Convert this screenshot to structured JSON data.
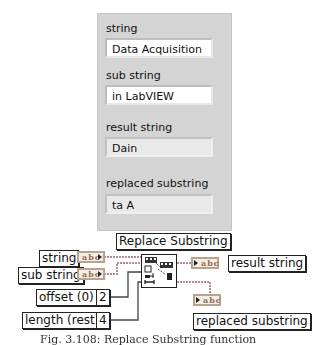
{
  "front_panel": {
    "controls": [
      {
        "label": "string",
        "value": "Data Acquisition",
        "kind": "control"
      },
      {
        "label": "sub string",
        "value": "in LabVIEW",
        "kind": "control"
      }
    ],
    "indicators": [
      {
        "label": "result string",
        "value": "Dain",
        "kind": "indicator"
      },
      {
        "label": "replaced substring",
        "value": "ta A",
        "kind": "indicator"
      }
    ]
  },
  "block_diagram": {
    "function_label": "Replace Substring",
    "inputs": [
      {
        "label": "string",
        "terminal": "abc"
      },
      {
        "label": "sub string",
        "terminal": "abc"
      },
      {
        "label": "offset (0)",
        "constant": "2"
      },
      {
        "label": "length (rest)",
        "constant": "4"
      }
    ],
    "outputs": [
      {
        "label": "result string",
        "terminal": "abc"
      },
      {
        "label": "replaced substring",
        "terminal": "abc"
      }
    ],
    "wire_colors": {
      "string": "#c39aa0",
      "numeric": "#3a3a3a"
    }
  },
  "caption": "Fig. 3.108: Replace Substring function"
}
